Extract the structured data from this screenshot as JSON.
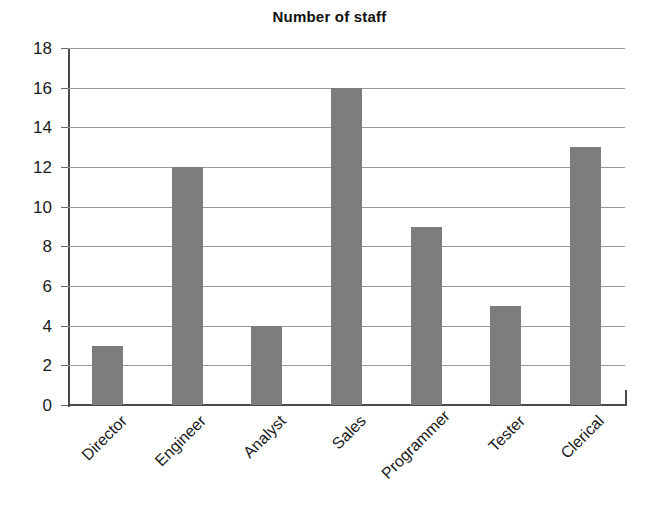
{
  "chart_data": {
    "type": "bar",
    "title": "Number of staff",
    "xlabel": "",
    "ylabel": "",
    "categories": [
      "Director",
      "Engineer",
      "Analyst",
      "Sales",
      "Programmer",
      "Tester",
      "Clerical"
    ],
    "values": [
      3,
      12,
      4,
      16,
      9,
      5,
      13
    ],
    "ylim": [
      0,
      18
    ],
    "ytick_step": 2,
    "yticks": [
      0,
      2,
      4,
      6,
      8,
      10,
      12,
      14,
      16,
      18
    ],
    "ytick_labels": [
      "0",
      "2",
      "4",
      "6",
      "8",
      "10",
      "12",
      "14",
      "16",
      "18"
    ],
    "grid": true,
    "grid_axis": "y",
    "legend": false,
    "legend_position": "none",
    "bar_color": "#7d7d7d",
    "axis_color": "#4a4a4a",
    "gridline_color": "#9a9a9a",
    "background_color": "#ffffff",
    "category_label_rotation": -45
  }
}
